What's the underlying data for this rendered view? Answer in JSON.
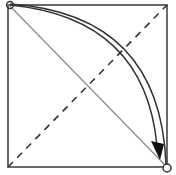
{
  "diagram": {
    "type": "origami-fold-diagram",
    "colors": {
      "background": "#ffffff",
      "stroke": "#333333",
      "diagonal": "#8a8a8a"
    },
    "square": {
      "x": 8,
      "y": 5,
      "size": 159
    },
    "elements": [
      {
        "id": "square-outline",
        "kind": "rect"
      },
      {
        "id": "solid-diagonal",
        "kind": "line",
        "from": "top-left",
        "to": "bottom-right"
      },
      {
        "id": "dashed-diagonal",
        "kind": "dashed-line",
        "from": "bottom-left",
        "to": "top-right",
        "meaning": "valley-fold"
      },
      {
        "id": "fold-arrow",
        "kind": "curved-arrow",
        "from": "top-left",
        "to": "bottom-right"
      },
      {
        "id": "corner-marker-start",
        "kind": "circle",
        "at": "top-left"
      },
      {
        "id": "corner-marker-end",
        "kind": "circle",
        "at": "bottom-right"
      }
    ]
  }
}
